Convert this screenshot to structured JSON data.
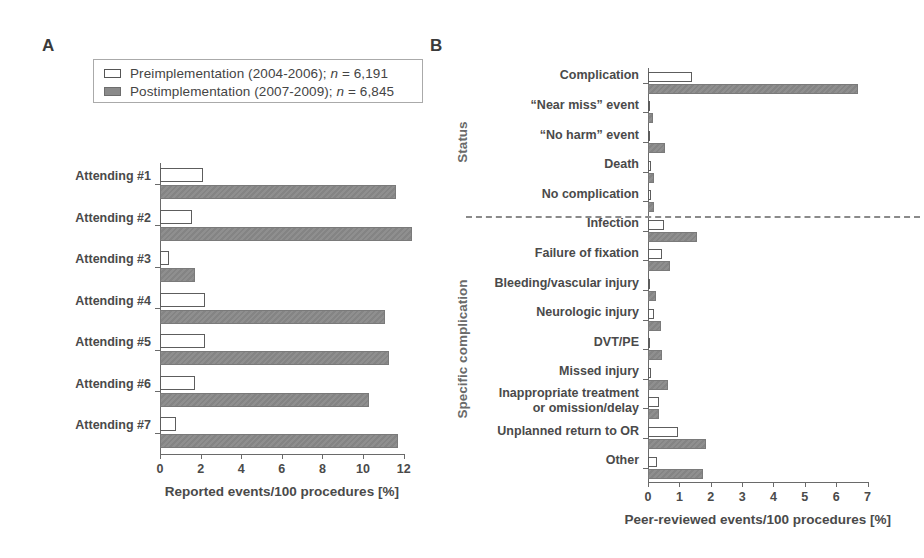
{
  "figure": {
    "panel_a_letter": "A",
    "panel_b_letter": "B"
  },
  "legend": {
    "pre": {
      "label_pre": "Preimplementation (2004-2006); ",
      "n_label": "n",
      "n_value": " = 6,191"
    },
    "post": {
      "label_pre": "Postimplementation (2007-2009); ",
      "n_label": "n",
      "n_value": " = 6,845"
    }
  },
  "chart_data": [
    {
      "id": "panel-a",
      "type": "bar",
      "orientation": "horizontal",
      "title": "A",
      "xlabel": "Reported events/100 procedures [%]",
      "ylabel": "",
      "xlim": [
        0,
        13
      ],
      "xticks": [
        0,
        2,
        4,
        6,
        8,
        10,
        12
      ],
      "xticklabels": [
        "0",
        "2",
        "4",
        "6",
        "8",
        "10",
        "12"
      ],
      "grid": false,
      "legend_position": "top-left",
      "categories": [
        "Attending #1",
        "Attending #2",
        "Attending #3",
        "Attending #4",
        "Attending #5",
        "Attending #6",
        "Attending #7"
      ],
      "series": [
        {
          "name": "Preimplementation (2004-2006); n = 6,191",
          "values": [
            2.1,
            1.6,
            0.45,
            2.2,
            2.2,
            1.7,
            0.8
          ]
        },
        {
          "name": "Postimplementation (2007-2009); n = 6,845",
          "values": [
            11.6,
            12.4,
            1.7,
            11.1,
            11.3,
            10.3,
            11.7
          ]
        }
      ]
    },
    {
      "id": "panel-b",
      "type": "bar",
      "orientation": "horizontal",
      "title": "B",
      "xlabel": "Peer-reviewed events/100 procedures [%]",
      "ylabel": "",
      "xlim": [
        0,
        7.3
      ],
      "xticks": [
        0,
        1,
        2,
        3,
        4,
        5,
        6,
        7
      ],
      "xticklabels": [
        "0",
        "1",
        "2",
        "3",
        "4",
        "5",
        "6",
        "7"
      ],
      "grid": false,
      "group_labels": [
        "Status",
        "Specific complication"
      ],
      "divider_after_category": "No complication",
      "categories": [
        "Complication",
        "“Near miss” event",
        "“No harm” event",
        "Death",
        "No complication",
        "Infection",
        "Failure of fixation",
        "Bleeding/vascular injury",
        "Neurologic injury",
        "DVT/PE",
        "Missed injury",
        "Inappropriate treatment or omission/delay",
        "Unplanned return to OR",
        "Other"
      ],
      "category_lines": [
        [
          "Complication"
        ],
        [
          "“Near miss” event"
        ],
        [
          "“No harm” event"
        ],
        [
          "Death"
        ],
        [
          "No complication"
        ],
        [
          "Infection"
        ],
        [
          "Failure of fixation"
        ],
        [
          "Bleeding/vascular injury"
        ],
        [
          "Neurologic injury"
        ],
        [
          "DVT/PE"
        ],
        [
          "Missed injury"
        ],
        [
          "Inappropriate treatment",
          "or omission/delay"
        ],
        [
          "Unplanned return to OR"
        ],
        [
          "Other"
        ]
      ],
      "series": [
        {
          "name": "Preimplementation (2004-2006); n = 6,191",
          "values": [
            1.4,
            0.06,
            0.05,
            0.1,
            0.1,
            0.5,
            0.45,
            0.07,
            0.2,
            0.05,
            0.1,
            0.35,
            0.95,
            0.3
          ]
        },
        {
          "name": "Postimplementation (2007-2009); n = 6,845",
          "values": [
            6.7,
            0.15,
            0.55,
            0.2,
            0.2,
            1.55,
            0.7,
            0.25,
            0.4,
            0.45,
            0.65,
            0.35,
            1.85,
            1.75
          ]
        }
      ]
    }
  ]
}
